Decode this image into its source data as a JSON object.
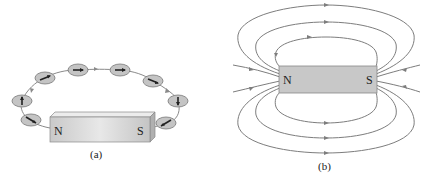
{
  "figure": {
    "panel_a": {
      "caption": "(a)",
      "magnet": {
        "north_label": "N",
        "south_label": "S"
      },
      "compass_count": 8,
      "description": "Compass needles arranged around a bar magnet trace a field line from N to S"
    },
    "panel_b": {
      "caption": "(b)",
      "magnet": {
        "north_label": "N",
        "south_label": "S"
      },
      "description": "Magnetic field lines around a bar magnet, leaving N and entering S"
    },
    "colors": {
      "magnet_fill": "#c8c8c8",
      "magnet_top": "#e2e2e2",
      "magnet_edge": "#7a7a7a",
      "field_line": "#7a7a7a",
      "compass_fill": "#c4c4c4",
      "needle": "#222222"
    }
  }
}
